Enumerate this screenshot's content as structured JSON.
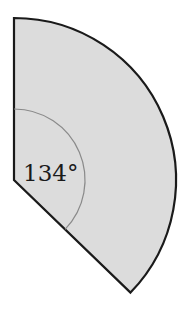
{
  "diagram": {
    "type": "circular-sector",
    "angle_label": "134°",
    "angle_degrees": 134,
    "colors": {
      "fill": "#dcdcdc",
      "outline": "#1a1a1a",
      "angle_arc": "#8a8a8a",
      "text": "#1a1a1a"
    }
  }
}
